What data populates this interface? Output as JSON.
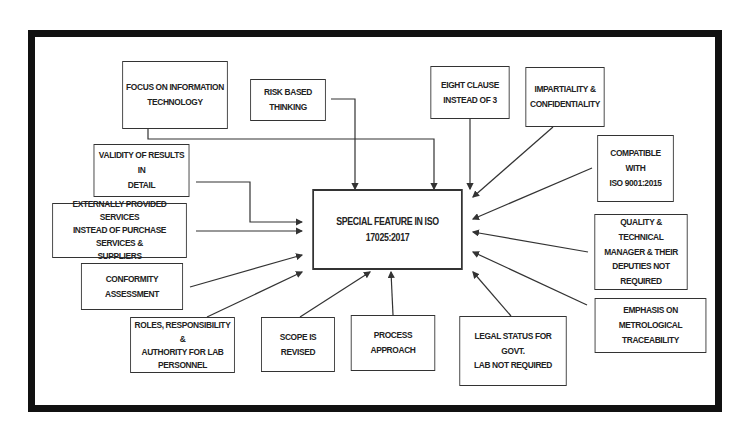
{
  "diagram": {
    "title": "SPECIAL FEATURE IN ISO 17025:2017",
    "colors": {
      "border": "#111111",
      "line": "#333333",
      "background": "#ffffff",
      "text": "#222222"
    },
    "nodes": [
      {
        "id": "focus-it",
        "label": "FOCUS ON INFORMATION\nTECHNOLOGY"
      },
      {
        "id": "risk-based",
        "label": "RISK BASED\nTHINKING"
      },
      {
        "id": "eight-clause",
        "label": "EIGHT CLAUSE\nINSTEAD OF 3"
      },
      {
        "id": "impartiality",
        "label": "IMPARTIALITY &\nCONFIDENTIALITY"
      },
      {
        "id": "compatible",
        "label": "COMPATIBLE WITH\nISO 9001:2015"
      },
      {
        "id": "validity",
        "label": "VALIDITY OF RESULTS IN\nDETAIL"
      },
      {
        "id": "externally",
        "label": "EXTERNALLY PROVIDED SERVICES\nINSTEAD OF PURCHASE SERVICES &\nSUPPLIERS"
      },
      {
        "id": "quality-manager",
        "label": "QUALITY & TECHNICAL\nMANAGER & THEIR\nDEPUTIES NOT REQUIRED"
      },
      {
        "id": "conformity",
        "label": "CONFORMITY ASSESSMENT"
      },
      {
        "id": "metrological",
        "label": "EMPHASIS ON METROLOGICAL\nTRACEABILITY"
      },
      {
        "id": "roles",
        "label": "ROLES, RESPONSIBILITY &\nAUTHORITY FOR LAB\nPERSONNEL"
      },
      {
        "id": "scope",
        "label": "SCOPE IS REVISED"
      },
      {
        "id": "process",
        "label": "PROCESS APPROACH"
      },
      {
        "id": "legal-status",
        "label": "LEGAL STATUS FOR GOVT.\nLAB NOT REQUIRED"
      }
    ],
    "edges_target": "SPECIAL FEATURE IN ISO 17025:2017"
  }
}
